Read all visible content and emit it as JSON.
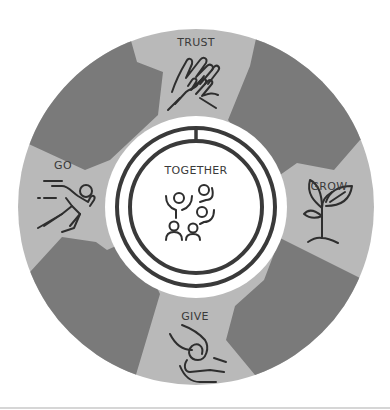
{
  "diagram": {
    "center": {
      "label": "TOGETHER",
      "icon": "group-celebrating-icon"
    },
    "segments": [
      {
        "label": "TRUST",
        "icon": "clasped-hands-icon",
        "position": "top"
      },
      {
        "label": "GROW",
        "icon": "sprout-plant-icon",
        "position": "right"
      },
      {
        "label": "GIVE",
        "icon": "giving-hands-icon",
        "position": "bottom"
      },
      {
        "label": "GO",
        "icon": "running-person-icon",
        "position": "left"
      }
    ],
    "colors": {
      "light_segment": "#b9b9b9",
      "dark_segment": "#7a7a7a",
      "center_fill": "#ffffff",
      "ring_stroke": "#3a3a3a",
      "icon_stroke": "#2e2e2e",
      "text": "#3a3a3a"
    }
  }
}
